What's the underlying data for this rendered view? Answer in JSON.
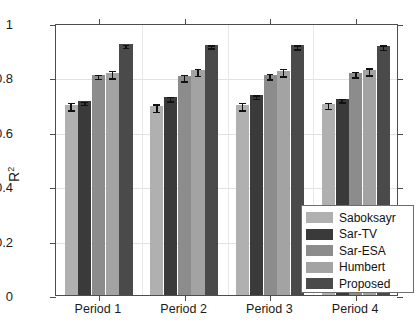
{
  "chart_data": {
    "type": "bar",
    "title": "",
    "xlabel": "",
    "ylabel": "R^2",
    "ylabel_display": "R",
    "ylabel_sup": "2",
    "categories": [
      "Period 1",
      "Period 2",
      "Period 3",
      "Period 4"
    ],
    "ylim": [
      0,
      1
    ],
    "yticks": [
      0,
      0.2,
      0.4,
      0.6,
      0.8,
      1
    ],
    "ytick_labels": [
      "0",
      "0.2",
      "0.4",
      "0.6",
      "0.8",
      "1"
    ],
    "grid": true,
    "legend_position": "bottom-right",
    "series": [
      {
        "name": "Saboksayr",
        "color": "#b0b0b0",
        "values": [
          0.7,
          0.695,
          0.7,
          0.703
        ],
        "errors": [
          0.013,
          0.014,
          0.014,
          0.012
        ]
      },
      {
        "name": "Sar-TV",
        "color": "#3a3a3a",
        "values": [
          0.712,
          0.727,
          0.735,
          0.722
        ],
        "errors": [
          0.005,
          0.008,
          0.006,
          0.006
        ]
      },
      {
        "name": "Sar-ESA",
        "color": "#8c8c8c",
        "values": [
          0.81,
          0.805,
          0.81,
          0.818
        ],
        "errors": [
          0.007,
          0.012,
          0.01,
          0.01
        ]
      },
      {
        "name": "Humbert",
        "color": "#a3a3a3",
        "values": [
          0.818,
          0.826,
          0.825,
          0.828
        ],
        "errors": [
          0.014,
          0.013,
          0.013,
          0.013
        ]
      },
      {
        "name": "Proposed",
        "color": "#4a4a4a",
        "values": [
          0.922,
          0.92,
          0.918,
          0.917
        ],
        "errors": [
          0.006,
          0.006,
          0.008,
          0.009
        ]
      }
    ]
  },
  "legend": {
    "items": [
      {
        "label": "Saboksayr",
        "color": "#b0b0b0"
      },
      {
        "label": "Sar-TV",
        "color": "#3a3a3a"
      },
      {
        "label": "Sar-ESA",
        "color": "#8c8c8c"
      },
      {
        "label": "Humbert",
        "color": "#a3a3a3"
      },
      {
        "label": "Proposed",
        "color": "#4a4a4a"
      }
    ]
  },
  "axes": {
    "box_color": "#4d4d4d",
    "grid_color": "#e2e2e2"
  }
}
